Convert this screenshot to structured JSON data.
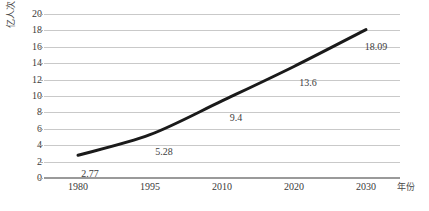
{
  "chart_data": {
    "type": "line",
    "title": "",
    "xlabel": "年份",
    "ylabel": "亿人次",
    "categories": [
      "1980",
      "1995",
      "2010",
      "2020",
      "2030"
    ],
    "values": [
      2.77,
      5.28,
      9.4,
      13.6,
      18.09
    ],
    "point_labels": [
      "2.77",
      "5.28",
      "9.4",
      "13.6",
      "18.09"
    ],
    "series": [
      {
        "name": "亿人次",
        "values": [
          2.77,
          5.28,
          9.4,
          13.6,
          18.09
        ]
      }
    ],
    "ylim": [
      0,
      20
    ],
    "y_ticks": [
      0,
      2,
      4,
      6,
      8,
      10,
      12,
      14,
      16,
      18,
      20
    ],
    "y_tick_labels": [
      "0",
      "2",
      "4",
      "6",
      "8",
      "10",
      "12",
      "14",
      "16",
      "18",
      "20"
    ],
    "grid": true,
    "grid_axis": "y",
    "legend": false,
    "legend_position": "none",
    "line_color": "#1a1a1a",
    "line_width": 3,
    "gridline_color": "#c9c9c9",
    "axis_color": "#9a9a9a",
    "background_color": "#ffffff",
    "markers": false
  }
}
